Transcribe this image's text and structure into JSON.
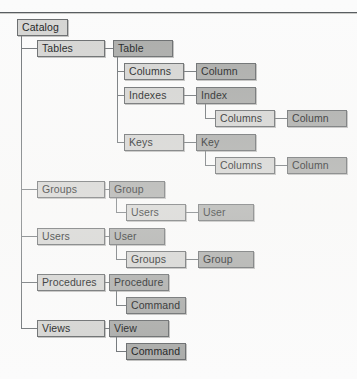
{
  "diagram": {
    "type": "tree",
    "colors": {
      "container_fill": "#d4d4d2",
      "item_fill": "#a9aaa8",
      "border": "#66696b",
      "line": "#6d7276",
      "page_background": "#fbfbfb",
      "text": "#17191a"
    },
    "nodes": [
      {
        "id": "catalog",
        "label": "Catalog",
        "kind": "root",
        "style": "light",
        "depth": 0,
        "x": 17,
        "y": 19,
        "w": 51
      },
      {
        "id": "tables",
        "label": "Tables",
        "kind": "container",
        "style": "light",
        "depth": 1,
        "x": 37,
        "y": 40,
        "w": 68
      },
      {
        "id": "table",
        "label": "Table",
        "kind": "item",
        "style": "dark",
        "depth": 2,
        "x": 113,
        "y": 40,
        "w": 60
      },
      {
        "id": "columns1",
        "label": "Columns",
        "kind": "container",
        "style": "light",
        "depth": 3,
        "x": 124,
        "y": 63,
        "w": 60
      },
      {
        "id": "column1",
        "label": "Column",
        "kind": "item",
        "style": "dark",
        "depth": 4,
        "x": 196,
        "y": 63,
        "w": 60
      },
      {
        "id": "indexes",
        "label": "Indexes",
        "kind": "container",
        "style": "light",
        "depth": 3,
        "x": 124,
        "y": 87,
        "w": 60
      },
      {
        "id": "index",
        "label": "Index",
        "kind": "item",
        "style": "dark",
        "depth": 4,
        "x": 196,
        "y": 87,
        "w": 60
      },
      {
        "id": "columns2",
        "label": "Columns",
        "kind": "container",
        "style": "light",
        "depth": 5,
        "x": 215,
        "y": 110,
        "w": 60
      },
      {
        "id": "column2",
        "label": "Column",
        "kind": "item",
        "style": "dark",
        "depth": 6,
        "x": 287,
        "y": 110,
        "w": 60
      },
      {
        "id": "keys",
        "label": "Keys",
        "kind": "container",
        "style": "light",
        "depth": 3,
        "x": 124,
        "y": 134,
        "w": 60
      },
      {
        "id": "key",
        "label": "Key",
        "kind": "item",
        "style": "dark",
        "depth": 4,
        "x": 196,
        "y": 134,
        "w": 60
      },
      {
        "id": "columns3",
        "label": "Columns",
        "kind": "container",
        "style": "light",
        "depth": 5,
        "x": 215,
        "y": 157,
        "w": 60
      },
      {
        "id": "column3",
        "label": "Column",
        "kind": "item",
        "style": "dark",
        "depth": 6,
        "x": 287,
        "y": 157,
        "w": 60
      },
      {
        "id": "groups",
        "label": "Groups",
        "kind": "container",
        "style": "light",
        "depth": 1,
        "x": 37,
        "y": 181,
        "w": 68
      },
      {
        "id": "group",
        "label": "Group",
        "kind": "item",
        "style": "dark",
        "depth": 2,
        "x": 109,
        "y": 181,
        "w": 56
      },
      {
        "id": "users_sub",
        "label": "Users",
        "kind": "container",
        "style": "light",
        "depth": 3,
        "x": 126,
        "y": 204,
        "w": 60
      },
      {
        "id": "user_leaf",
        "label": "User",
        "kind": "item",
        "style": "dark",
        "depth": 4,
        "x": 198,
        "y": 204,
        "w": 56
      },
      {
        "id": "users",
        "label": "Users",
        "kind": "container",
        "style": "light",
        "depth": 1,
        "x": 37,
        "y": 228,
        "w": 68
      },
      {
        "id": "user",
        "label": "User",
        "kind": "item",
        "style": "dark",
        "depth": 2,
        "x": 109,
        "y": 228,
        "w": 56
      },
      {
        "id": "groups_sub",
        "label": "Groups",
        "kind": "container",
        "style": "light",
        "depth": 3,
        "x": 126,
        "y": 251,
        "w": 60
      },
      {
        "id": "group_leaf",
        "label": "Group",
        "kind": "item",
        "style": "dark",
        "depth": 4,
        "x": 198,
        "y": 251,
        "w": 56
      },
      {
        "id": "procedures",
        "label": "Procedures",
        "kind": "container",
        "style": "light",
        "depth": 1,
        "x": 37,
        "y": 274,
        "w": 68
      },
      {
        "id": "procedure",
        "label": "Procedure",
        "kind": "item",
        "style": "dark",
        "depth": 2,
        "x": 109,
        "y": 274,
        "w": 60
      },
      {
        "id": "command1",
        "label": "Command",
        "kind": "item",
        "style": "dark",
        "depth": 3,
        "x": 126,
        "y": 297,
        "w": 60
      },
      {
        "id": "views",
        "label": "Views",
        "kind": "container",
        "style": "light",
        "depth": 1,
        "x": 37,
        "y": 320,
        "w": 68
      },
      {
        "id": "view",
        "label": "View",
        "kind": "item",
        "style": "dark",
        "depth": 2,
        "x": 109,
        "y": 320,
        "w": 60
      },
      {
        "id": "command2",
        "label": "Command",
        "kind": "item",
        "style": "dark",
        "depth": 3,
        "x": 126,
        "y": 343,
        "w": 60
      }
    ],
    "edges": [
      {
        "from": "catalog",
        "to": "tables"
      },
      {
        "from": "catalog",
        "to": "groups"
      },
      {
        "from": "catalog",
        "to": "users"
      },
      {
        "from": "catalog",
        "to": "procedures"
      },
      {
        "from": "catalog",
        "to": "views"
      },
      {
        "from": "tables",
        "to": "table"
      },
      {
        "from": "table",
        "to": "columns1"
      },
      {
        "from": "table",
        "to": "indexes"
      },
      {
        "from": "table",
        "to": "keys"
      },
      {
        "from": "columns1",
        "to": "column1"
      },
      {
        "from": "indexes",
        "to": "index"
      },
      {
        "from": "index",
        "to": "columns2"
      },
      {
        "from": "columns2",
        "to": "column2"
      },
      {
        "from": "keys",
        "to": "key"
      },
      {
        "from": "key",
        "to": "columns3"
      },
      {
        "from": "columns3",
        "to": "column3"
      },
      {
        "from": "groups",
        "to": "group"
      },
      {
        "from": "group",
        "to": "users_sub"
      },
      {
        "from": "users_sub",
        "to": "user_leaf"
      },
      {
        "from": "users",
        "to": "user"
      },
      {
        "from": "user",
        "to": "groups_sub"
      },
      {
        "from": "groups_sub",
        "to": "group_leaf"
      },
      {
        "from": "procedures",
        "to": "procedure"
      },
      {
        "from": "procedure",
        "to": "command1"
      },
      {
        "from": "views",
        "to": "view"
      },
      {
        "from": "view",
        "to": "command2"
      }
    ]
  }
}
